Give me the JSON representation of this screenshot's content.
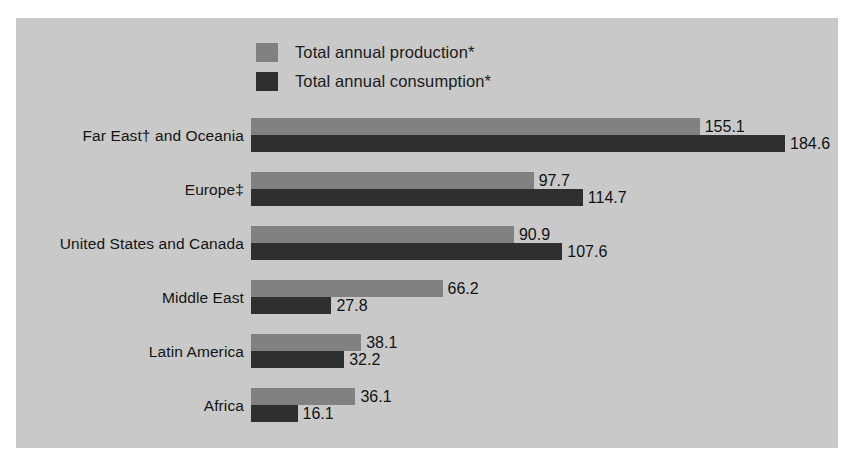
{
  "chart_data": {
    "type": "bar",
    "orientation": "horizontal",
    "title": "",
    "subtitle": "",
    "xlabel": "",
    "ylabel": "",
    "grid": false,
    "legend_position": "top-left",
    "xlim": [
      0,
      184.6
    ],
    "categories": [
      "Far East† and Oceania",
      "Europe‡",
      "United States and Canada",
      "Middle East",
      "Latin America",
      "Africa"
    ],
    "series": [
      {
        "name": "Total annual production*",
        "color": "#818181",
        "values": [
          155.1,
          97.7,
          90.9,
          66.2,
          38.1,
          36.1
        ],
        "value_labels": [
          "155.1",
          "97.7",
          "90.9",
          "66.2",
          "38.1",
          "36.1"
        ]
      },
      {
        "name": "Total annual consumption*",
        "color": "#2f2f2f",
        "values": [
          184.6,
          114.7,
          107.6,
          27.8,
          32.2,
          16.1
        ],
        "value_labels": [
          "184.6",
          "114.7",
          "107.6",
          "27.8",
          "32.2",
          "16.1"
        ]
      }
    ]
  },
  "legend": {
    "items": [
      {
        "label": "Total annual production*",
        "color": "#818181"
      },
      {
        "label": "Total annual consumption*",
        "color": "#2f2f2f"
      }
    ]
  },
  "colors": {
    "panel_background": "#c9c9c9",
    "page_background": "#ffffff",
    "production": "#818181",
    "consumption": "#2f2f2f",
    "text": "#141414"
  }
}
